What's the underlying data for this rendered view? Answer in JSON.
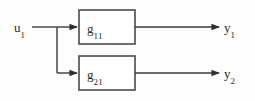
{
  "diagram": {
    "type": "block-diagram",
    "title": "",
    "background_color": "#fdfdfd",
    "line_color": "#3a3a3a",
    "box_border_color": "#4a4a4a",
    "box_fill_color": "#ffffff",
    "text_color": "#2b2b2b",
    "input": {
      "name": "u1",
      "base": "u",
      "subscript": "1"
    },
    "blocks": [
      {
        "id": "g11",
        "base": "g",
        "subscript": "11",
        "x": 79,
        "y": 10,
        "width": 56,
        "height": 34
      },
      {
        "id": "g21",
        "base": "g",
        "subscript": "21",
        "x": 79,
        "y": 56,
        "width": 56,
        "height": 34
      }
    ],
    "outputs": [
      {
        "id": "y1",
        "base": "y",
        "subscript": "1"
      },
      {
        "id": "y2",
        "base": "y",
        "subscript": "2"
      }
    ],
    "connections": [
      {
        "from": "u1",
        "to": "g11",
        "kind": "input-line"
      },
      {
        "from": "u1",
        "to": "g21",
        "kind": "branch-line"
      },
      {
        "from": "g11",
        "to": "y1",
        "kind": "output-line"
      },
      {
        "from": "g21",
        "to": "y2",
        "kind": "output-line"
      }
    ]
  }
}
